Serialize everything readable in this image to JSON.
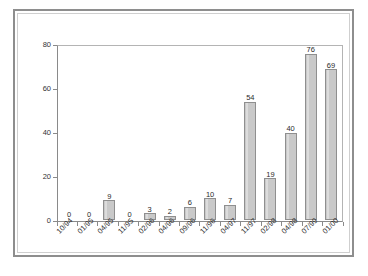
{
  "chart_data": {
    "type": "bar",
    "title": "",
    "subtitle": "",
    "xlabel": "",
    "ylabel": "",
    "ylim": [
      0,
      80
    ],
    "yticks": [
      0,
      20,
      40,
      60,
      80
    ],
    "grid": false,
    "legend": "none",
    "bar_color": "#c9c9c9",
    "bar_border_color": "#8f8f8f",
    "categories": [
      "10/94",
      "01/95",
      "04/95",
      "11/95",
      "02/96",
      "04/96",
      "09/96",
      "11/96",
      "04/97",
      "11/97",
      "02/98",
      "04/98",
      "07/99",
      "01/00"
    ],
    "values": [
      0,
      0,
      9,
      0,
      3,
      2,
      6,
      10,
      7,
      54,
      19,
      40,
      76,
      69
    ],
    "data_labels": [
      "0",
      "0",
      "9",
      "0",
      "3",
      "2",
      "6",
      "10",
      "7",
      "54",
      "19",
      "40",
      "76",
      "69"
    ]
  }
}
